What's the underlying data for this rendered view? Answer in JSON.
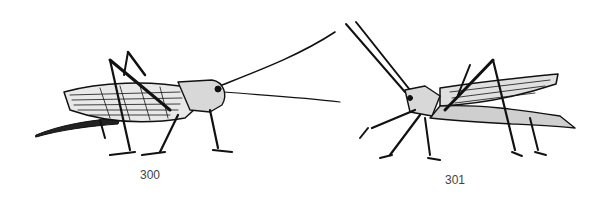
{
  "figures": [
    {
      "caption": "300",
      "subject": "katydid / bush-cricket, facing right, long antennae"
    },
    {
      "caption": "301",
      "subject": "grasshopper, facing left, raised antennae"
    }
  ],
  "colors": {
    "ink": "#111111",
    "background": "#ffffff",
    "caption": "#444444"
  }
}
